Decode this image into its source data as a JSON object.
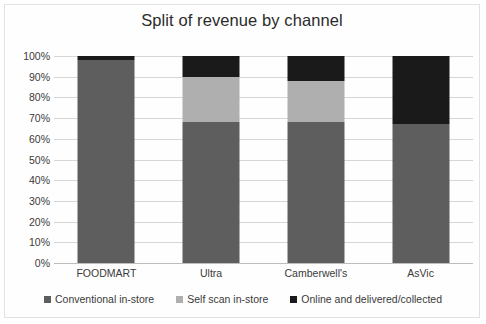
{
  "chart_data": {
    "type": "bar",
    "subtype": "stacked-column-100",
    "title": "Split of revenue by channel",
    "xlabel": "",
    "ylabel": "",
    "ylim": [
      0,
      100
    ],
    "ytick_labels": [
      "100%",
      "90%",
      "80%",
      "70%",
      "60%",
      "50%",
      "40%",
      "30%",
      "20%",
      "10%",
      "0%"
    ],
    "ytick_values": [
      100,
      90,
      80,
      70,
      60,
      50,
      40,
      30,
      20,
      10,
      0
    ],
    "grid": true,
    "legend_position": "bottom",
    "categories": [
      "FOODMART",
      "Ultra",
      "Camberwell's",
      "AsVic"
    ],
    "series": [
      {
        "name": "Conventional in-store",
        "color": "#5e5e5e",
        "values": [
          98,
          68,
          68,
          67
        ]
      },
      {
        "name": "Self scan in-store",
        "color": "#afafaf",
        "values": [
          0,
          22,
          20,
          0
        ]
      },
      {
        "name": "Online and delivered/collected",
        "color": "#1a1a1a",
        "values": [
          2,
          10,
          12,
          33
        ]
      }
    ]
  }
}
